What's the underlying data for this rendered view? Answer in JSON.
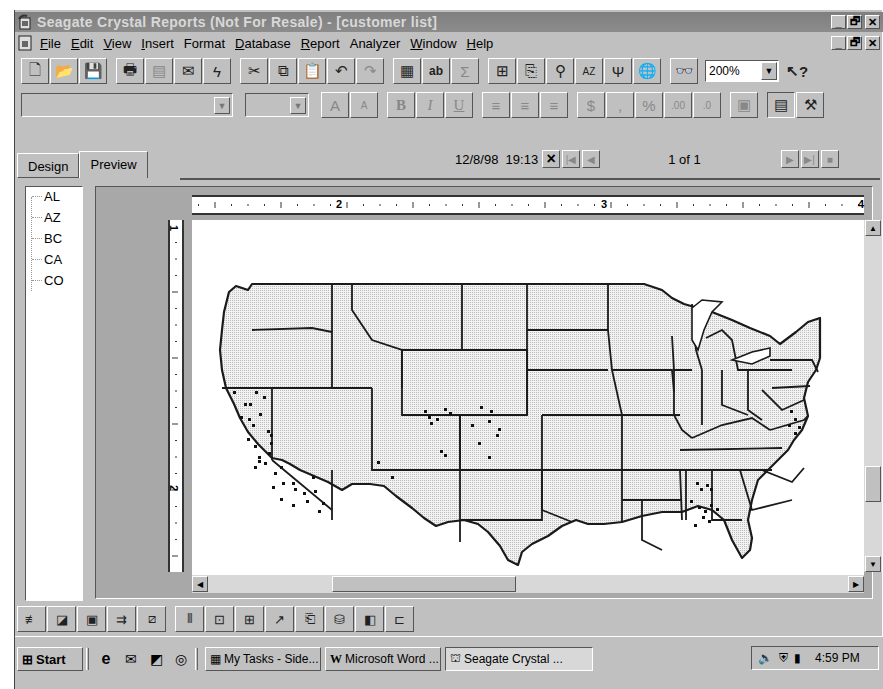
{
  "window": {
    "title": "Seagate Crystal Reports (Not For Resale) - [customer list]",
    "caption_buttons": [
      "minimize",
      "restore",
      "close"
    ]
  },
  "menu": {
    "items": [
      {
        "label": "File",
        "accel": "F"
      },
      {
        "label": "Edit",
        "accel": "E"
      },
      {
        "label": "View",
        "accel": "V"
      },
      {
        "label": "Insert",
        "accel": "I"
      },
      {
        "label": "Format",
        "accel": "a"
      },
      {
        "label": "Database",
        "accel": "D"
      },
      {
        "label": "Report",
        "accel": "R"
      },
      {
        "label": "Analyzer",
        "accel": "z"
      },
      {
        "label": "Window",
        "accel": "W"
      },
      {
        "label": "Help",
        "accel": "H"
      }
    ]
  },
  "standard_toolbar": {
    "buttons": [
      {
        "name": "new-report",
        "icon": "document-icon",
        "enabled": true
      },
      {
        "name": "open",
        "icon": "folder-open-icon",
        "enabled": true
      },
      {
        "name": "save",
        "icon": "floppy-icon",
        "enabled": true
      },
      {
        "name": "print",
        "icon": "printer-icon",
        "enabled": true
      },
      {
        "name": "print-preview",
        "icon": "preview-icon",
        "enabled": false
      },
      {
        "name": "export",
        "icon": "export-envelope-icon",
        "enabled": true
      },
      {
        "name": "refresh",
        "icon": "lightning-icon",
        "enabled": true
      },
      {
        "name": "cut",
        "icon": "scissors-icon",
        "enabled": true
      },
      {
        "name": "copy",
        "icon": "copy-icon",
        "enabled": true
      },
      {
        "name": "paste",
        "icon": "paste-icon",
        "enabled": true
      },
      {
        "name": "undo",
        "icon": "undo-icon",
        "enabled": true
      },
      {
        "name": "redo",
        "icon": "redo-icon",
        "enabled": false
      },
      {
        "name": "insert-database-field",
        "icon": "database-field-icon",
        "enabled": true
      },
      {
        "name": "insert-text-object",
        "icon": "text-object-icon",
        "enabled": true
      },
      {
        "name": "insert-summary",
        "icon": "sigma-icon",
        "enabled": false
      },
      {
        "name": "insert-group",
        "icon": "group-icon",
        "enabled": true
      },
      {
        "name": "insert-subreport",
        "icon": "subreport-icon",
        "enabled": true
      },
      {
        "name": "insert-chart",
        "icon": "chart-icon",
        "enabled": true
      },
      {
        "name": "sort-order",
        "icon": "sort-az-icon",
        "enabled": true
      },
      {
        "name": "select-expert",
        "icon": "filter-icon",
        "enabled": true
      },
      {
        "name": "map-expert",
        "icon": "globe-icon",
        "enabled": true
      },
      {
        "name": "find",
        "icon": "binoculars-icon",
        "enabled": true
      }
    ],
    "zoom": {
      "value": "200%"
    },
    "help_button": {
      "label": "?",
      "icon": "context-help-icon"
    }
  },
  "format_toolbar": {
    "font_name": {
      "value": ""
    },
    "font_size": {
      "value": ""
    },
    "buttons": [
      {
        "name": "increase-font",
        "glyph": "A",
        "enabled": false
      },
      {
        "name": "decrease-font",
        "glyph": "A",
        "enabled": false
      },
      {
        "name": "bold",
        "glyph": "B",
        "enabled": false
      },
      {
        "name": "italic",
        "glyph": "I",
        "enabled": false
      },
      {
        "name": "underline",
        "glyph": "U",
        "enabled": false
      },
      {
        "name": "align-left",
        "glyph": "≡",
        "enabled": false
      },
      {
        "name": "align-center",
        "glyph": "≡",
        "enabled": false
      },
      {
        "name": "align-right",
        "glyph": "≡",
        "enabled": false
      },
      {
        "name": "currency",
        "glyph": "$",
        "enabled": false
      },
      {
        "name": "thousands-separator",
        "glyph": ",",
        "enabled": false
      },
      {
        "name": "percent",
        "glyph": "%",
        "enabled": false
      },
      {
        "name": "increase-decimals",
        "glyph": ".00",
        "enabled": false
      },
      {
        "name": "decrease-decimals",
        "glyph": ".0",
        "enabled": false
      },
      {
        "name": "suppress",
        "glyph": "▣",
        "enabled": false
      },
      {
        "name": "toggle-group-tree",
        "glyph": "▤",
        "enabled": true
      },
      {
        "name": "options",
        "glyph": "⚒",
        "enabled": true
      }
    ]
  },
  "tabs": [
    {
      "label": "Design",
      "active": false
    },
    {
      "label": "Preview",
      "active": true
    }
  ],
  "preview_nav": {
    "timestamp": "12/8/98  19:13",
    "page_indicator": "1 of 1",
    "close_view": "×",
    "first_page": "|◀",
    "prev_page": "◀",
    "next_page": "▶",
    "last_page": "▶|",
    "stop": "■"
  },
  "group_tree": {
    "items": [
      "AL",
      "AZ",
      "BC",
      "CA",
      "CO"
    ]
  },
  "rulers": {
    "horizontal_labels": [
      "2",
      "3",
      "4"
    ],
    "vertical_labels": [
      "1",
      "2"
    ]
  },
  "report": {
    "content": "US map with customer locations plotted as dot-density markers",
    "states_with_markers": [
      "CA",
      "CO",
      "AZ",
      "AL",
      "MD"
    ],
    "map_fill": "#e0e0e0",
    "marker_color": "#111111"
  },
  "insert_toolbar": {
    "buttons": [
      "insert-formula-icon",
      "insert-special-field-icon",
      "insert-picture-icon",
      "insert-line-icon",
      "insert-box-icon",
      "insert-crosstab-icon",
      "insert-ole-icon",
      "insert-grid-icon",
      "insert-chart-icon",
      "insert-report-icon",
      "insert-database-icon",
      "insert-template-icon",
      "insert-map-icon"
    ]
  },
  "taskbar": {
    "start_label": "Start",
    "quick_launch": [
      "internet-explorer-icon",
      "outlook-express-icon",
      "show-desktop-icon",
      "channels-icon"
    ],
    "tasks": [
      {
        "label": "My Tasks - Side...",
        "icon": "tasks-icon",
        "active": false
      },
      {
        "label": "Microsoft Word ...",
        "icon": "word-icon",
        "active": false
      },
      {
        "label": "Seagate Crystal ...",
        "icon": "crystal-icon",
        "active": true
      }
    ],
    "tray_icons": [
      "speaker-icon",
      "antivirus-icon",
      "battery-icon"
    ],
    "clock": "4:59 PM"
  }
}
